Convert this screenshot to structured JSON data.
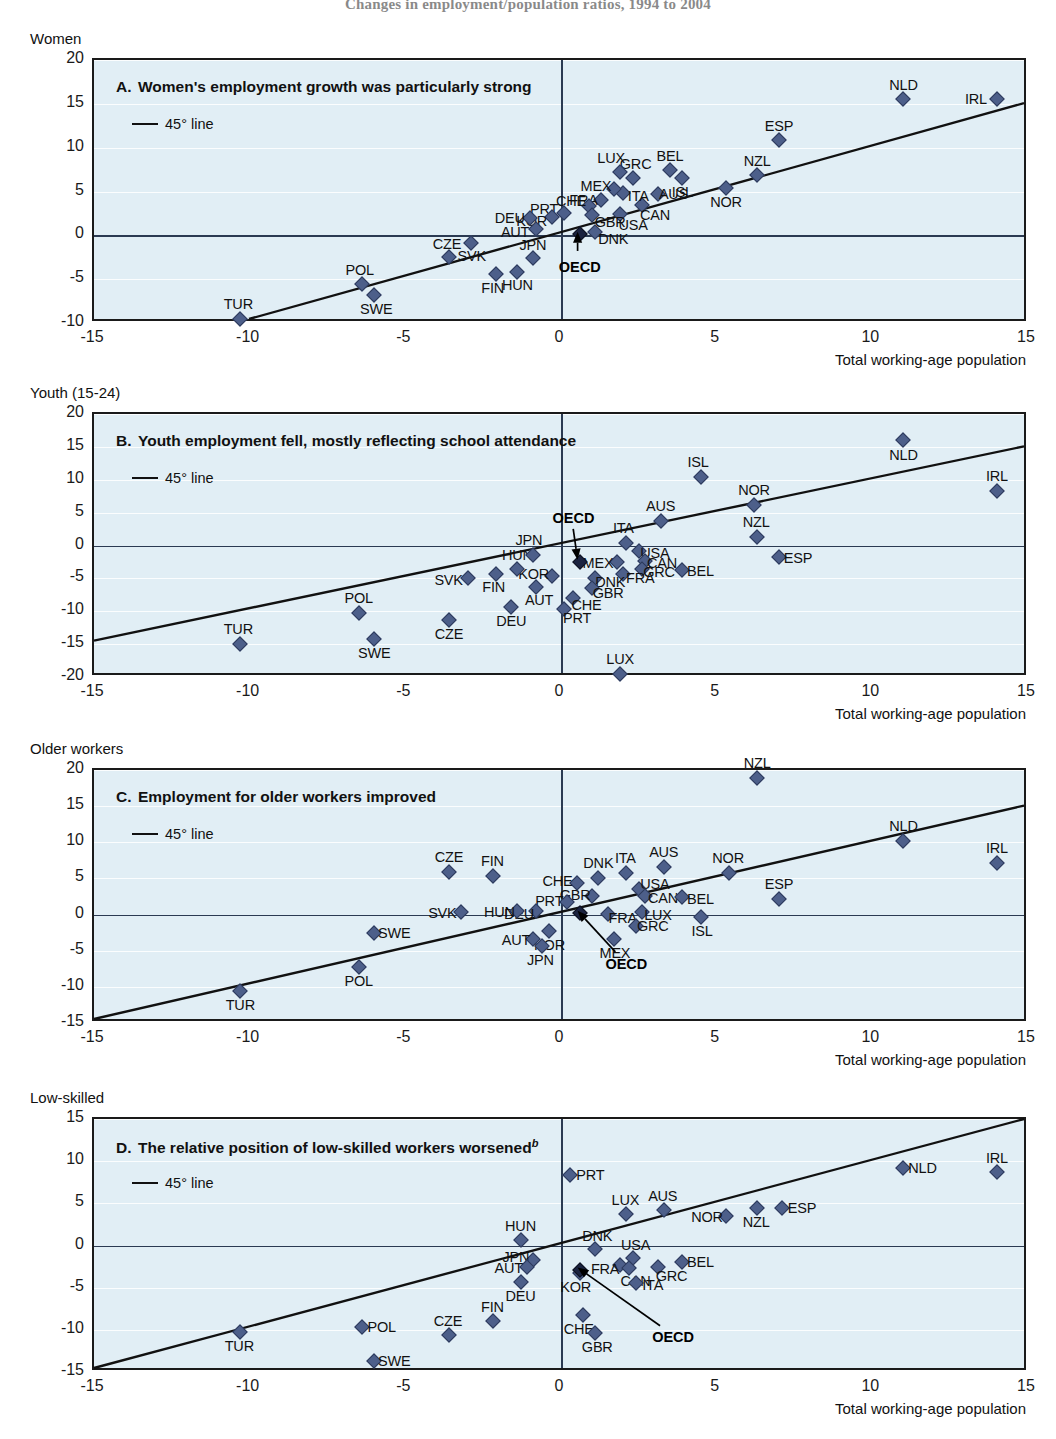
{
  "figure": {
    "title": "Changes in employment/population ratios, 1994 to 2004",
    "xlabel": "Total working-age population",
    "legend_label": "45° line"
  },
  "chart_data": [
    {
      "type": "scatter",
      "group_label": "Women",
      "panel_letter": "A.",
      "title": "Women's employment growth was particularly strong",
      "xlabel": "Total working-age population",
      "ylabel": "",
      "xlim": [
        -15,
        15
      ],
      "ylim": [
        -10,
        20
      ],
      "xticks": [
        -15,
        -10,
        -5,
        0,
        5,
        10,
        15
      ],
      "yticks": [
        -10,
        -5,
        0,
        5,
        10,
        15,
        20
      ],
      "grid": true,
      "legend": [
        "45° line"
      ],
      "points": [
        {
          "code": "IRL",
          "x": 14.0,
          "y": 15.6,
          "lx": -21,
          "ly": 0
        },
        {
          "code": "NLD",
          "x": 11.0,
          "y": 15.5,
          "lx": 0,
          "ly": -14
        },
        {
          "code": "ESP",
          "x": 7.0,
          "y": 10.9,
          "lx": 0,
          "ly": -14
        },
        {
          "code": "NZL",
          "x": 6.3,
          "y": 6.9,
          "lx": 0,
          "ly": -14
        },
        {
          "code": "NOR",
          "x": 5.3,
          "y": 5.4,
          "lx": 0,
          "ly": 14
        },
        {
          "code": "ISL",
          "x": 3.9,
          "y": 6.5,
          "lx": 0,
          "ly": 14
        },
        {
          "code": "BEL",
          "x": 3.5,
          "y": 7.4,
          "lx": 0,
          "ly": -14
        },
        {
          "code": "AUS",
          "x": 3.1,
          "y": 4.7,
          "lx": 16,
          "ly": 0
        },
        {
          "code": "GRC",
          "x": 2.3,
          "y": 6.5,
          "lx": 3,
          "ly": -14
        },
        {
          "code": "CAN",
          "x": 2.6,
          "y": 3.5,
          "lx": 13,
          "ly": 10
        },
        {
          "code": "LUX",
          "x": 1.9,
          "y": 7.2,
          "lx": -9,
          "ly": -14
        },
        {
          "code": "ITA",
          "x": 2.0,
          "y": 4.8,
          "lx": 15,
          "ly": 3
        },
        {
          "code": "MEX",
          "x": 1.7,
          "y": 5.3,
          "lx": -18,
          "ly": -3
        },
        {
          "code": "FRA",
          "x": 1.3,
          "y": 4.0,
          "lx": -18,
          "ly": 0
        },
        {
          "code": "USA",
          "x": 1.9,
          "y": 2.4,
          "lx": 13,
          "ly": 11
        },
        {
          "code": "CHE",
          "x": 0.9,
          "y": 3.4,
          "lx": -18,
          "ly": -5
        },
        {
          "code": "GBR",
          "x": 1.0,
          "y": 2.3,
          "lx": 18,
          "ly": 7
        },
        {
          "code": "DNK",
          "x": 1.1,
          "y": 0.4,
          "lx": 18,
          "ly": 7
        },
        {
          "code": "PRT",
          "x": 0.1,
          "y": 2.5,
          "lx": -20,
          "ly": -4
        },
        {
          "code": "KOR",
          "x": -0.3,
          "y": 2.1,
          "lx": -20,
          "ly": 4
        },
        {
          "code": "DEU",
          "x": -1.0,
          "y": 2.0,
          "lx": -20,
          "ly": 0
        },
        {
          "code": "AUT",
          "x": -0.8,
          "y": 0.7,
          "lx": -21,
          "ly": 3
        },
        {
          "code": "JPN",
          "x": -0.9,
          "y": -2.6,
          "lx": 0,
          "ly": -13
        },
        {
          "code": "SVK",
          "x": -2.9,
          "y": -0.9,
          "lx": 1,
          "ly": 13
        },
        {
          "code": "HUN",
          "x": -1.4,
          "y": -4.2,
          "lx": 0,
          "ly": 13
        },
        {
          "code": "FIN",
          "x": -2.1,
          "y": -4.4,
          "lx": -3,
          "ly": 14
        },
        {
          "code": "CZE",
          "x": -3.6,
          "y": -2.5,
          "lx": -2,
          "ly": -13
        },
        {
          "code": "POL",
          "x": -6.4,
          "y": -5.5,
          "lx": -2,
          "ly": -14
        },
        {
          "code": "SWE",
          "x": -6.0,
          "y": -6.8,
          "lx": 2,
          "ly": 14
        },
        {
          "code": "TUR",
          "x": -10.3,
          "y": -9.5,
          "lx": -2,
          "ly": -15
        },
        {
          "code": "OECD",
          "x": 0.6,
          "y": 0.1,
          "lx": 0,
          "ly": 0,
          "highlight": true
        }
      ],
      "oecd_annotation": {
        "label": "OECD",
        "label_x": 0.6,
        "label_y": -3.6
      }
    },
    {
      "type": "scatter",
      "group_label": "Youth (15-24)",
      "panel_letter": "B.",
      "title": "Youth employment fell, mostly reflecting school attendance",
      "xlabel": "Total working-age population",
      "ylabel": "",
      "xlim": [
        -15,
        15
      ],
      "ylim": [
        -20,
        20
      ],
      "xticks": [
        -15,
        -10,
        -5,
        0,
        5,
        10,
        15
      ],
      "yticks": [
        -20,
        -15,
        -10,
        -5,
        0,
        5,
        10,
        15,
        20
      ],
      "grid": true,
      "legend": [
        "45° line"
      ],
      "points": [
        {
          "code": "NLD",
          "x": 11.0,
          "y": 16.0,
          "lx": 0,
          "ly": 15
        },
        {
          "code": "IRL",
          "x": 14.0,
          "y": 8.3,
          "lx": 0,
          "ly": -15
        },
        {
          "code": "ISL",
          "x": 4.5,
          "y": 10.4,
          "lx": -3,
          "ly": -15
        },
        {
          "code": "NOR",
          "x": 6.2,
          "y": 6.2,
          "lx": 0,
          "ly": -15
        },
        {
          "code": "AUS",
          "x": 3.2,
          "y": 3.8,
          "lx": 0,
          "ly": -15
        },
        {
          "code": "NZL",
          "x": 6.3,
          "y": 1.3,
          "lx": -1,
          "ly": -15
        },
        {
          "code": "ITA",
          "x": 2.1,
          "y": 0.4,
          "lx": -3,
          "ly": -15
        },
        {
          "code": "USA",
          "x": 2.5,
          "y": -0.9,
          "lx": 16,
          "ly": 2
        },
        {
          "code": "ESP",
          "x": 7.0,
          "y": -1.7,
          "lx": 19,
          "ly": 1
        },
        {
          "code": "CAN",
          "x": 2.7,
          "y": -2.4,
          "lx": 17,
          "ly": 2
        },
        {
          "code": "MEX",
          "x": 1.8,
          "y": -2.5,
          "lx": -19,
          "ly": 1
        },
        {
          "code": "GRC",
          "x": 2.6,
          "y": -3.6,
          "lx": 17,
          "ly": 3
        },
        {
          "code": "BEL",
          "x": 3.9,
          "y": -3.7,
          "lx": 18,
          "ly": 1
        },
        {
          "code": "FRA",
          "x": 2.0,
          "y": -4.3,
          "lx": 17,
          "ly": 4
        },
        {
          "code": "DNK",
          "x": 1.1,
          "y": -4.9,
          "lx": 15,
          "ly": 4
        },
        {
          "code": "GBR",
          "x": 1.0,
          "y": -6.5,
          "lx": 16,
          "ly": 5
        },
        {
          "code": "CHE",
          "x": 0.4,
          "y": -8.0,
          "lx": 13,
          "ly": 7
        },
        {
          "code": "PRT",
          "x": 0.1,
          "y": -9.7,
          "lx": 13,
          "ly": 9
        },
        {
          "code": "KOR",
          "x": -0.3,
          "y": -4.6,
          "lx": -18,
          "ly": -2
        },
        {
          "code": "AUT",
          "x": -0.8,
          "y": -6.3,
          "lx": 3,
          "ly": 13
        },
        {
          "code": "HUN",
          "x": -1.4,
          "y": -3.5,
          "lx": 0,
          "ly": -14
        },
        {
          "code": "FIN",
          "x": -2.1,
          "y": -4.3,
          "lx": -2,
          "ly": 13
        },
        {
          "code": "SVK",
          "x": -3.0,
          "y": -5.0,
          "lx": -19,
          "ly": 2
        },
        {
          "code": "DEU",
          "x": -1.6,
          "y": -9.4,
          "lx": 0,
          "ly": 14
        },
        {
          "code": "JPN",
          "x": -0.9,
          "y": -1.4,
          "lx": -4,
          "ly": -15
        },
        {
          "code": "CZE",
          "x": -3.6,
          "y": -11.4,
          "lx": 0,
          "ly": 14
        },
        {
          "code": "POL",
          "x": -6.5,
          "y": -10.3,
          "lx": 0,
          "ly": -15
        },
        {
          "code": "SWE",
          "x": -6.0,
          "y": -14.2,
          "lx": 0,
          "ly": 14
        },
        {
          "code": "TUR",
          "x": -10.3,
          "y": -15.0,
          "lx": -2,
          "ly": -15
        },
        {
          "code": "LUX",
          "x": 1.9,
          "y": -19.6,
          "lx": 0,
          "ly": -15
        },
        {
          "code": "OECD",
          "x": 0.6,
          "y": -2.5,
          "lx": 0,
          "ly": 0,
          "highlight": true
        }
      ],
      "oecd_annotation": {
        "label": "OECD",
        "label_x": 0.4,
        "label_y": 4.2
      }
    },
    {
      "type": "scatter",
      "group_label": "Older workers",
      "panel_letter": "C.",
      "title": "Employment for older workers improved",
      "xlabel": "Total working-age population",
      "ylabel": "",
      "xlim": [
        -15,
        15
      ],
      "ylim": [
        -15,
        20
      ],
      "xticks": [
        -15,
        -10,
        -5,
        0,
        5,
        10,
        15
      ],
      "yticks": [
        -15,
        -10,
        -5,
        0,
        5,
        10,
        15,
        20
      ],
      "grid": true,
      "legend": [
        "45° line"
      ],
      "points": [
        {
          "code": "NZL",
          "x": 6.3,
          "y": 18.9,
          "lx": 0,
          "ly": -15
        },
        {
          "code": "NLD",
          "x": 11.0,
          "y": 10.2,
          "lx": 0,
          "ly": -15
        },
        {
          "code": "IRL",
          "x": 14.0,
          "y": 7.1,
          "lx": 0,
          "ly": -15
        },
        {
          "code": "NOR",
          "x": 5.4,
          "y": 5.8,
          "lx": -1,
          "ly": -15
        },
        {
          "code": "AUS",
          "x": 3.3,
          "y": 6.6,
          "lx": 0,
          "ly": -15
        },
        {
          "code": "ESP",
          "x": 7.0,
          "y": 2.2,
          "lx": 0,
          "ly": -15
        },
        {
          "code": "CZE",
          "x": -3.6,
          "y": 5.9,
          "lx": 0,
          "ly": -15
        },
        {
          "code": "FIN",
          "x": -2.2,
          "y": 5.3,
          "lx": 0,
          "ly": -15
        },
        {
          "code": "ITA",
          "x": 2.1,
          "y": 5.8,
          "lx": -1,
          "ly": -15
        },
        {
          "code": "DNK",
          "x": 1.2,
          "y": 5.1,
          "lx": 0,
          "ly": -15
        },
        {
          "code": "CHE",
          "x": 0.5,
          "y": 4.3,
          "lx": -19,
          "ly": -2
        },
        {
          "code": "USA",
          "x": 2.5,
          "y": 3.6,
          "lx": 16,
          "ly": -5
        },
        {
          "code": "CAN",
          "x": 2.7,
          "y": 2.6,
          "lx": 18,
          "ly": 2
        },
        {
          "code": "BEL",
          "x": 3.9,
          "y": 2.4,
          "lx": 18,
          "ly": 2
        },
        {
          "code": "GBR",
          "x": 1.0,
          "y": 2.6,
          "lx": -17,
          "ly": -1
        },
        {
          "code": "PRT",
          "x": 0.2,
          "y": 1.8,
          "lx": -18,
          "ly": -1
        },
        {
          "code": "LUX",
          "x": 2.6,
          "y": 0.4,
          "lx": 16,
          "ly": 3
        },
        {
          "code": "FRA",
          "x": 1.5,
          "y": 0.1,
          "lx": 15,
          "ly": 4
        },
        {
          "code": "DEU",
          "x": -0.8,
          "y": 0.5,
          "lx": -17,
          "ly": 3
        },
        {
          "code": "HUN",
          "x": -1.4,
          "y": 0.5,
          "lx": -18,
          "ly": 1
        },
        {
          "code": "SVK",
          "x": -3.2,
          "y": 0.3,
          "lx": -19,
          "ly": 1
        },
        {
          "code": "ISL",
          "x": 4.5,
          "y": -0.4,
          "lx": 1,
          "ly": 14
        },
        {
          "code": "GRC",
          "x": 2.4,
          "y": -1.6,
          "lx": 17,
          "ly": 0
        },
        {
          "code": "KOR",
          "x": -0.4,
          "y": -2.3,
          "lx": 1,
          "ly": 14
        },
        {
          "code": "MEX",
          "x": 1.7,
          "y": -3.4,
          "lx": 1,
          "ly": 14
        },
        {
          "code": "AUT",
          "x": -0.9,
          "y": -3.4,
          "lx": -17,
          "ly": 1
        },
        {
          "code": "JPN",
          "x": -0.6,
          "y": -4.3,
          "lx": -2,
          "ly": 14
        },
        {
          "code": "SWE",
          "x": -6.0,
          "y": -2.6,
          "lx": 20,
          "ly": 0
        },
        {
          "code": "POL",
          "x": -6.5,
          "y": -7.3,
          "lx": 0,
          "ly": 14
        },
        {
          "code": "TUR",
          "x": -10.3,
          "y": -10.6,
          "lx": 0,
          "ly": 14
        },
        {
          "code": "OECD",
          "x": 0.6,
          "y": 0.2,
          "lx": 0,
          "ly": 0,
          "highlight": true
        }
      ],
      "oecd_annotation": {
        "label": "OECD",
        "label_x": 2.1,
        "label_y": -6.9
      }
    },
    {
      "type": "scatter",
      "group_label": "Low-skilled",
      "panel_letter": "D.",
      "title": "The relative position of low-skilled workers worsened",
      "title_superscript": "b",
      "xlabel": "Total working-age population",
      "ylabel": "",
      "xlim": [
        -15,
        15
      ],
      "ylim": [
        -15,
        15
      ],
      "xticks": [
        -15,
        -10,
        -5,
        0,
        5,
        10,
        15
      ],
      "yticks": [
        -15,
        -10,
        -5,
        0,
        5,
        10,
        15
      ],
      "grid": true,
      "legend": [
        "45° line"
      ],
      "points": [
        {
          "code": "NLD",
          "x": 11.0,
          "y": 9.2,
          "lx": 19,
          "ly": 0
        },
        {
          "code": "IRL",
          "x": 14.0,
          "y": 8.7,
          "lx": 0,
          "ly": -14
        },
        {
          "code": "PRT",
          "x": 0.3,
          "y": 8.4,
          "lx": 20,
          "ly": 0
        },
        {
          "code": "ESP",
          "x": 7.1,
          "y": 4.4,
          "lx": 20,
          "ly": 0
        },
        {
          "code": "NZL",
          "x": 6.3,
          "y": 4.5,
          "lx": -1,
          "ly": 14
        },
        {
          "code": "NOR",
          "x": 5.3,
          "y": 3.5,
          "lx": -19,
          "ly": 1
        },
        {
          "code": "AUS",
          "x": 3.3,
          "y": 4.2,
          "lx": -1,
          "ly": -14
        },
        {
          "code": "LUX",
          "x": 2.1,
          "y": 3.7,
          "lx": -1,
          "ly": -14
        },
        {
          "code": "HUN",
          "x": -1.3,
          "y": 0.6,
          "lx": 0,
          "ly": -14
        },
        {
          "code": "DNK",
          "x": 1.1,
          "y": -0.4,
          "lx": 2,
          "ly": -13
        },
        {
          "code": "USA",
          "x": 2.3,
          "y": -1.5,
          "lx": 3,
          "ly": -13
        },
        {
          "code": "BEL",
          "x": 3.9,
          "y": -1.9,
          "lx": 18,
          "ly": 0
        },
        {
          "code": "GRC",
          "x": 3.1,
          "y": -2.6,
          "lx": 14,
          "ly": 9
        },
        {
          "code": "FRA",
          "x": 1.9,
          "y": -2.3,
          "lx": -15,
          "ly": 4
        },
        {
          "code": "CAN",
          "x": 2.2,
          "y": -2.7,
          "lx": 6,
          "ly": 13
        },
        {
          "code": "ITA",
          "x": 2.4,
          "y": -4.5,
          "lx": 17,
          "ly": 2
        },
        {
          "code": "JPN",
          "x": -0.9,
          "y": -1.7,
          "lx": -17,
          "ly": -3
        },
        {
          "code": "AUT",
          "x": -1.1,
          "y": -2.6,
          "lx": -18,
          "ly": 1
        },
        {
          "code": "KOR",
          "x": 0.6,
          "y": -3.3,
          "lx": -4,
          "ly": 14
        },
        {
          "code": "DEU",
          "x": -1.3,
          "y": -4.3,
          "lx": 0,
          "ly": 14
        },
        {
          "code": "CHE",
          "x": 0.7,
          "y": -8.3,
          "lx": -4,
          "ly": 14
        },
        {
          "code": "GBR",
          "x": 1.1,
          "y": -10.4,
          "lx": 2,
          "ly": 14
        },
        {
          "code": "FIN",
          "x": -2.2,
          "y": -8.9,
          "lx": 0,
          "ly": -14
        },
        {
          "code": "CZE",
          "x": -3.6,
          "y": -10.6,
          "lx": -1,
          "ly": -14
        },
        {
          "code": "POL",
          "x": -6.4,
          "y": -9.7,
          "lx": 20,
          "ly": 0
        },
        {
          "code": "TUR",
          "x": -10.3,
          "y": -10.3,
          "lx": -1,
          "ly": 14
        },
        {
          "code": "SWE",
          "x": -6.0,
          "y": -13.7,
          "lx": 20,
          "ly": 0
        },
        {
          "code": "OECD",
          "x": 0.6,
          "y": -2.9,
          "lx": 0,
          "ly": 0,
          "highlight": true
        }
      ],
      "oecd_annotation": {
        "label": "OECD",
        "label_x": 3.6,
        "label_y": -10.8
      }
    }
  ]
}
